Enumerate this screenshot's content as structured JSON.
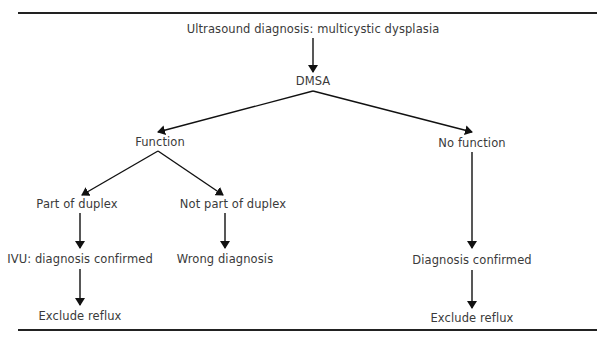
{
  "diagram": {
    "type": "flowchart",
    "nodes": {
      "root": "Ultrasound diagnosis: multicystic dysplasia",
      "dmsa": "DMSA",
      "function": "Function",
      "no_function": "No function",
      "part_of_duplex": "Part of duplex",
      "not_part_of_duplex": "Not part of duplex",
      "ivu_confirmed": "IVU: diagnosis confirmed",
      "wrong_diagnosis": "Wrong diagnosis",
      "exclude_reflux_left": "Exclude reflux",
      "diagnosis_confirmed": "Diagnosis confirmed",
      "exclude_reflux_right": "Exclude reflux"
    },
    "edges": [
      [
        "root",
        "dmsa"
      ],
      [
        "dmsa",
        "function"
      ],
      [
        "dmsa",
        "no_function"
      ],
      [
        "function",
        "part_of_duplex"
      ],
      [
        "function",
        "not_part_of_duplex"
      ],
      [
        "part_of_duplex",
        "ivu_confirmed"
      ],
      [
        "not_part_of_duplex",
        "wrong_diagnosis"
      ],
      [
        "ivu_confirmed",
        "exclude_reflux_left"
      ],
      [
        "no_function",
        "diagnosis_confirmed"
      ],
      [
        "diagnosis_confirmed",
        "exclude_reflux_right"
      ]
    ]
  }
}
